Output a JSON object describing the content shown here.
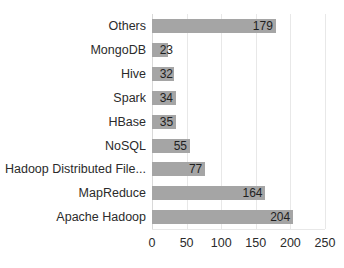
{
  "chart_data": {
    "type": "bar",
    "orientation": "horizontal",
    "title": "",
    "subtitle": "",
    "xlabel": "",
    "ylabel": "",
    "xlim": [
      0,
      250
    ],
    "ylim": null,
    "grid": true,
    "legend": null,
    "legend_position": "none",
    "xticks": [
      0,
      50,
      100,
      150,
      200,
      250
    ],
    "xtick_labels": [
      "0",
      "50",
      "100",
      "150",
      "200",
      "250"
    ],
    "categories": [
      "Others",
      "MongoDB",
      "Hive",
      "Spark",
      "HBase",
      "NoSQL",
      "Hadoop Distributed File...",
      "MapReduce",
      "Apache Hadoop"
    ],
    "values": [
      179,
      23,
      32,
      34,
      35,
      55,
      77,
      164,
      204
    ],
    "value_labels": [
      "179",
      "23",
      "32",
      "34",
      "35",
      "55",
      "77",
      "164",
      "204"
    ],
    "bar_color": "#a5a5a5",
    "background_color": "#ffffff",
    "grid_color": "#e8e8e8",
    "text_color": "#2b2b2b"
  }
}
